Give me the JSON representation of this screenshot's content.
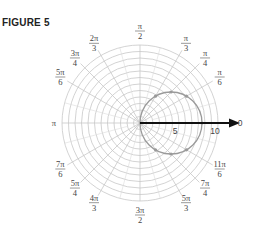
{
  "figure": {
    "title": "FIGURE 5"
  },
  "polar_grid": {
    "center": [
      140,
      123
    ],
    "ring_count": 12,
    "ring_spacing_px": 6.5,
    "grid_color": "#c8c8c8",
    "spoke_angles_deg": [
      0,
      30,
      45,
      60,
      90,
      120,
      135,
      150,
      180,
      210,
      225,
      240,
      270,
      300,
      315,
      330
    ]
  },
  "angle_labels": [
    {
      "num": "π",
      "den": "2",
      "angle_deg": 90
    },
    {
      "num": "π",
      "den": "3",
      "angle_deg": 60
    },
    {
      "num": "π",
      "den": "4",
      "angle_deg": 45
    },
    {
      "num": "π",
      "den": "6",
      "angle_deg": 30
    },
    {
      "num": "2π",
      "den": "3",
      "angle_deg": 120
    },
    {
      "num": "3π",
      "den": "4",
      "angle_deg": 135
    },
    {
      "num": "5π",
      "den": "6",
      "angle_deg": 150
    },
    {
      "num": "π",
      "den": "",
      "angle_deg": 180
    },
    {
      "num": "7π",
      "den": "6",
      "angle_deg": 210
    },
    {
      "num": "5π",
      "den": "4",
      "angle_deg": 225
    },
    {
      "num": "4π",
      "den": "3",
      "angle_deg": 240
    },
    {
      "num": "3π",
      "den": "2",
      "angle_deg": 270
    },
    {
      "num": "5π",
      "den": "3",
      "angle_deg": 300
    },
    {
      "num": "7π",
      "den": "4",
      "angle_deg": 315
    },
    {
      "num": "11π",
      "den": "6",
      "angle_deg": 330
    },
    {
      "num": "0",
      "den": "",
      "angle_deg": 0
    }
  ],
  "axis": {
    "tick_labels": [
      "5",
      "10"
    ],
    "arrow_color": "#111111"
  },
  "curve": {
    "description": "circle r = 10 cos θ",
    "diameter": 10,
    "color": "#9a9a9a",
    "points_deg": [
      0,
      30,
      45,
      60,
      300,
      315,
      330
    ]
  }
}
